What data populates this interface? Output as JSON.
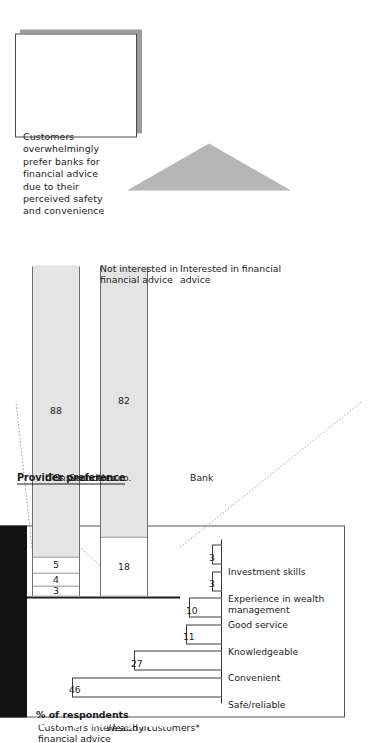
{
  "callout": {
    "text": "Customers overwhelmingly prefer banks for financial advice due to their perceived safety and convenience"
  },
  "bar_chart": {
    "title": "Reasons for preferring banks",
    "axis_caption": "% of respondents"
  },
  "provider_preference": {
    "title": "Provider preference",
    "legend": {
      "itcs": "ITCs",
      "insurance": "Insurance co.",
      "securities": "Securities co.",
      "bank": "Bank"
    }
  },
  "stacked": {
    "rows": [
      {
        "axis_label": "Customers interested in financial advice",
        "segments": [
          {
            "label": "3",
            "value": 3,
            "fill": "white"
          },
          {
            "label": "4",
            "value": 4,
            "fill": "white"
          },
          {
            "label": "5",
            "value": 5,
            "fill": "white"
          },
          {
            "label": "88",
            "value": 88,
            "fill": "gray"
          }
        ]
      },
      {
        "axis_label": "Wealthy customers*",
        "segments": [
          {
            "label": "18",
            "value": 18,
            "fill": "white"
          },
          {
            "label": "82",
            "value": 82,
            "fill": "gray"
          }
        ]
      }
    ],
    "notes": {
      "not_interested": "Not interested in financial advice",
      "interested": "Interested in financial advice"
    }
  },
  "chart_data": {
    "type": "bar",
    "title": "Reasons for preferring banks",
    "xlabel": "",
    "ylabel": "% of respondents",
    "ylim": [
      0,
      50
    ],
    "grid": false,
    "legend": "none",
    "orientation": "vertical",
    "categories": [
      "Safe/reliable",
      "Convenient",
      "Knowledgeable",
      "Good service",
      "Experience in wealth management",
      "Investment skills"
    ],
    "values": [
      46,
      27,
      11,
      10,
      3,
      3
    ],
    "secondary_chart": {
      "type": "bar",
      "stacked": true,
      "orientation": "horizontal",
      "title": "Provider preference",
      "categories": [
        "Wealthy customers*",
        "Customers interested in financial advice"
      ],
      "series": [
        {
          "name": "Bank",
          "values": [
            82,
            88
          ]
        },
        {
          "name": "Securities co.",
          "values": [
            null,
            5
          ]
        },
        {
          "name": "Insurance co.",
          "values": [
            null,
            4
          ]
        },
        {
          "name": "ITCs",
          "values": [
            null,
            3
          ]
        },
        {
          "name": "Not interested in financial advice",
          "values": [
            18,
            null
          ]
        }
      ],
      "annotations": [
        "Interested in financial advice",
        "Not interested in financial advice"
      ]
    }
  }
}
